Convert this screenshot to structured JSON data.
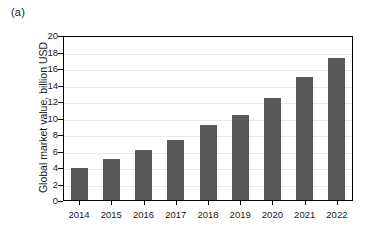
{
  "panel": {
    "label": "(a)"
  },
  "chart_data": {
    "type": "bar",
    "title": "",
    "subtitle": "",
    "xlabel": "",
    "ylabel": "Global market value, billion USD",
    "categories": [
      "2014",
      "2015",
      "2016",
      "2017",
      "2018",
      "2019",
      "2020",
      "2021",
      "2022"
    ],
    "values": [
      4.0,
      5.1,
      6.2,
      7.4,
      9.2,
      10.4,
      12.5,
      15.0,
      17.4
    ],
    "ylim": [
      0,
      20
    ],
    "ytick_step": 2,
    "yticks": [
      "20",
      "18",
      "16",
      "14",
      "12",
      "10",
      "8",
      "6",
      "4",
      "2",
      "0"
    ],
    "grid": "horizontal",
    "legend": "none",
    "bar_color": "#595959",
    "grid_color": "#e9e9e9",
    "axis_color": "#000000",
    "background_color": "#ffffff",
    "annotations": []
  }
}
